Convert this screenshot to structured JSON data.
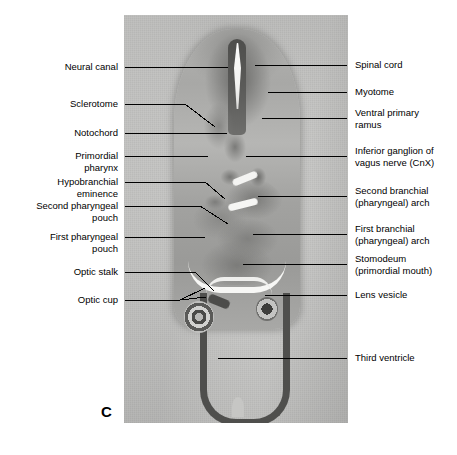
{
  "figure": {
    "panel_letter": "C",
    "caption_note": "",
    "specimen_type": "histological-section-photomicrograph"
  },
  "labels_left": [
    {
      "id": "neural-canal",
      "text": "Neural canal"
    },
    {
      "id": "sclerotome",
      "text": "Sclerotome"
    },
    {
      "id": "notochord",
      "text": "Notochord"
    },
    {
      "id": "primordial-pharynx",
      "text": "Primordial\npharynx"
    },
    {
      "id": "hypobranchial-eminence",
      "text": "Hypobranchial\neminence"
    },
    {
      "id": "second-pharyngeal-pouch",
      "text": "Second pharyngeal\npouch"
    },
    {
      "id": "first-pharyngeal-pouch",
      "text": "First pharyngeal\npouch"
    },
    {
      "id": "optic-stalk",
      "text": "Optic stalk"
    },
    {
      "id": "optic-cup",
      "text": "Optic cup"
    }
  ],
  "labels_right": [
    {
      "id": "spinal-cord",
      "text": "Spinal cord"
    },
    {
      "id": "myotome",
      "text": "Myotome"
    },
    {
      "id": "ventral-primary-ramus",
      "text": "Ventral primary\nramus"
    },
    {
      "id": "inferior-ganglion-vagus",
      "text": "Inferior ganglion of\nvagus nerve (CnX)"
    },
    {
      "id": "second-branchial-arch",
      "text": "Second branchial\n(pharyngeal) arch"
    },
    {
      "id": "first-branchial-arch",
      "text": "First branchial\n(pharyngeal) arch"
    },
    {
      "id": "stomodeum",
      "text": "Stomodeum\n(primordial mouth)"
    },
    {
      "id": "lens-vesicle",
      "text": "Lens vesicle"
    },
    {
      "id": "third-ventricle",
      "text": "Third ventricle"
    }
  ],
  "colors": {
    "background": "#ffffff",
    "text": "#000000",
    "leader_line": "#000000",
    "panel_base": "#c9c9c9"
  }
}
